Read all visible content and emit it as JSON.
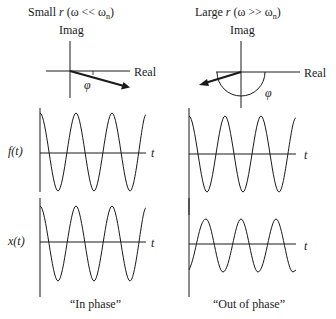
{
  "left_panel": {
    "title_prefix": "Small ",
    "title_var": "r",
    "title_cond": "(ω << ω",
    "title_sub": "n",
    "title_close": ")",
    "imag_label": "Imag",
    "real_label": "Real",
    "phi_label": "φ",
    "caption": "“In phase”"
  },
  "right_panel": {
    "title_prefix": "Large ",
    "title_var": "r",
    "title_cond": "(ω >> ω",
    "title_sub": "n",
    "title_close": ")",
    "imag_label": "Imag",
    "real_label": "Real",
    "phi_label": "φ",
    "caption": "“Out of phase”"
  },
  "plots": {
    "f_label": "f(t)",
    "x_label": "x(t)",
    "t_label": "t"
  },
  "colors": {
    "ink": "#1a1a1a",
    "background": "#ffffff"
  }
}
